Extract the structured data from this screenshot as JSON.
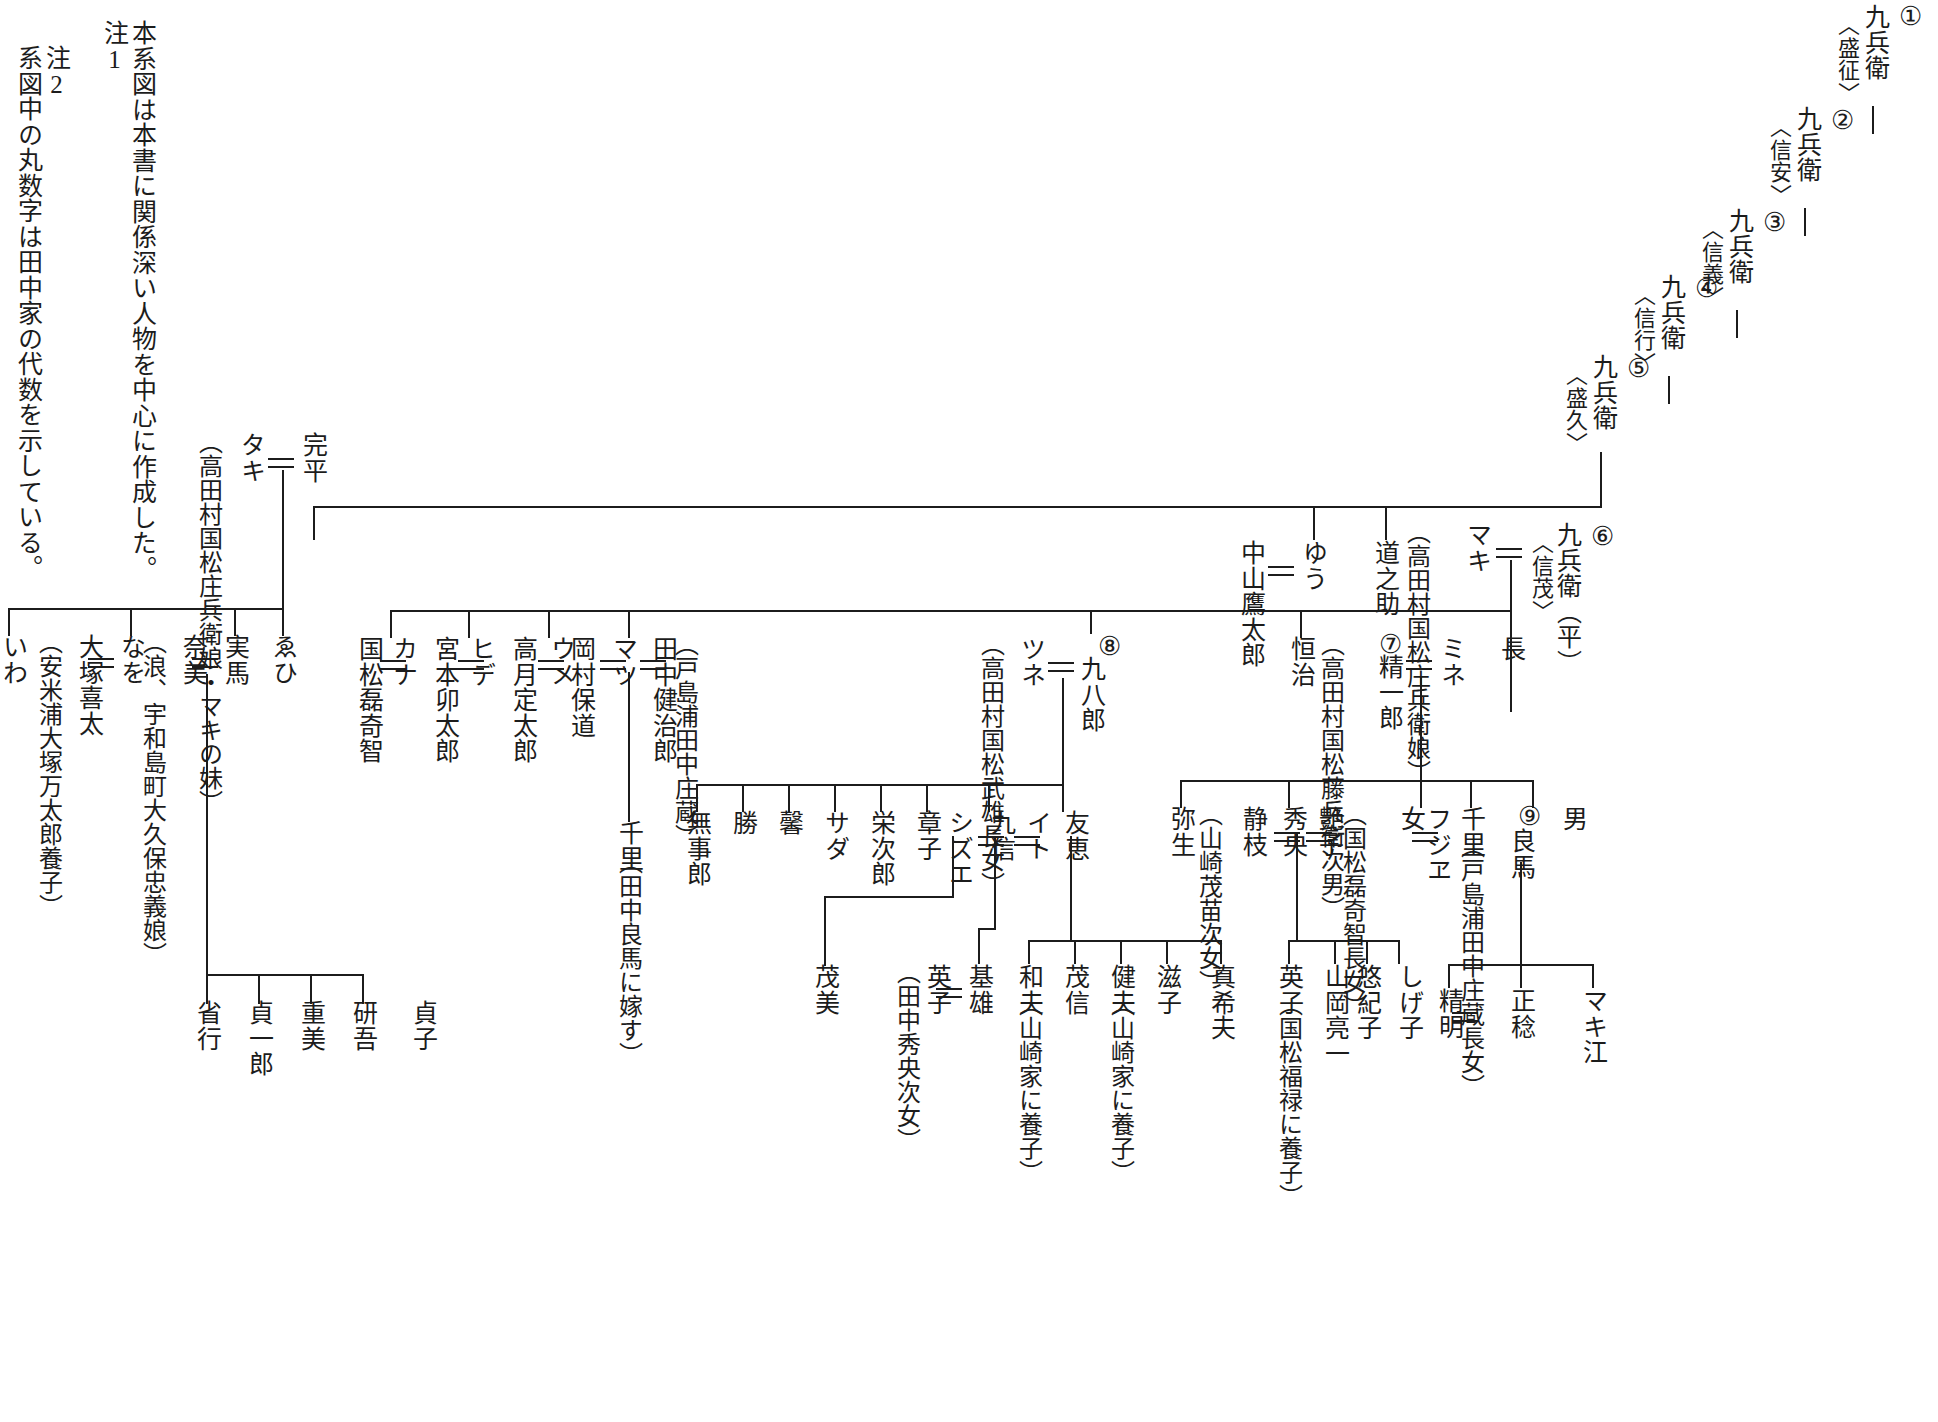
{
  "notes": [
    {
      "label": "注1",
      "text": "本系図は本書に関係深い人物を中心に作成した。"
    },
    {
      "label": "注2",
      "text": "系図中の丸数字は田中家の代数を示している。"
    }
  ],
  "generations": [
    {
      "num": "①",
      "name": "九兵衛",
      "kakumei": "〈盛征〉"
    },
    {
      "num": "②",
      "name": "九兵衛",
      "kakumei": "〈信安〉"
    },
    {
      "num": "③",
      "name": "九兵衛",
      "kakumei": "〈信義〉"
    },
    {
      "num": "④",
      "name": "九兵衛",
      "kakumei": "〈信行〉"
    },
    {
      "num": "⑤",
      "name": "九兵衛",
      "kakumei": "〈盛久〉"
    },
    {
      "num": "⑥",
      "name": "九兵衛（平）",
      "kakumei": "〈信茂〉"
    }
  ],
  "gen6_row": {
    "head": "九兵衛（平）",
    "head_kakumei": "〈信茂〉",
    "head_num": "⑥",
    "spouse": "マキ",
    "spouse_note": "高田村国松庄兵衛娘",
    "siblings": [
      {
        "name": "ゆう",
        "spouse": "中山鷹太郎"
      },
      {
        "name": "道之助"
      }
    ]
  },
  "gen6_children": [
    {
      "name": "長"
    },
    {
      "name": "ミネ",
      "spouse": "精一郎",
      "spouse_num": "⑦",
      "spouse_note": "高田村国松藤兵衛次男"
    },
    {
      "name": "恒治"
    },
    {
      "name": "九八郎",
      "num": "⑧",
      "spouse": "ツネ",
      "spouse_note": "高田村国松武雄長女"
    },
    {
      "name": "完平",
      "spouse": "タキ",
      "spouse_note": "高田村国松庄兵衛娘・マキの妹"
    }
  ],
  "kanpei_children": [
    {
      "name": "ゑひ"
    },
    {
      "name": "実馬",
      "spouse": "奈美",
      "spouse_note": "浪、宇和島町大久保忠義娘"
    },
    {
      "name": "なを",
      "spouse": "大塚喜太",
      "spouse_note": "安米浦大塚万太郎養子"
    },
    {
      "name": "いわ"
    }
  ],
  "jitsuma_children": [
    "貞子",
    "研吾",
    "重美",
    "貞一郎",
    "省行"
  ],
  "makimine_children": [
    {
      "name": "国松磊奇智",
      "spouse": "カナ"
    },
    {
      "name": "宮本卯太郎",
      "spouse": "ヒデ"
    },
    {
      "name": "高月定太郎",
      "spouse": "ウメ"
    },
    {
      "name": "岡村保道",
      "spouse": "マツ",
      "spouse2": "田中健治郎",
      "spouse2_note": "戸島浦田中庄蔵"
    }
  ],
  "matsu_child": {
    "name": "千里",
    "note": "田中良馬に嫁す"
  },
  "kuhachiro_children": [
    "無事郎",
    "勝",
    "馨",
    "サダ",
    "栄次郎",
    "章子",
    {
      "name": "九信",
      "spouse": "シズエ"
    },
    "イト",
    {
      "name": "友恵"
    }
  ],
  "shizue_child": "茂美",
  "kunobu_children": [
    {
      "name": "基雄",
      "spouse": "英子",
      "spouse_note": "田中秀央次女"
    }
  ],
  "tomoe_children": [
    {
      "name": "和夫",
      "note": "山崎家に養子"
    },
    {
      "name": "茂信"
    },
    {
      "name": "健夫",
      "note": "山崎家に養子"
    },
    {
      "name": "滋子"
    },
    {
      "name": "真希夫"
    }
  ],
  "seiichiro_children": [
    {
      "name": "弥生"
    },
    {
      "name": "秀央",
      "spouse": "静枝",
      "spouse_note": "山崎茂苗次女",
      "spouse2": "艶子",
      "spouse2_note": "国松磊奇智長女"
    },
    {
      "name": "女",
      "spouse": "フジヱ",
      "spouse_note": "高田村"
    },
    {
      "name": "千里",
      "spouse_note": "戸島浦田中庄蔵長女"
    },
    {
      "name": "良馬",
      "num": "⑨"
    },
    {
      "name": "男"
    }
  ],
  "hideo_children": [
    {
      "name": "英子",
      "note": "国松福禄に養子"
    },
    {
      "name": "山岡亮一"
    },
    {
      "name": "悠紀子"
    },
    {
      "name": "しげ子"
    }
  ],
  "ryoma_children": [
    "精明",
    "正稔",
    "マキ江"
  ],
  "colors": {
    "line": "#1c1c1c",
    "bg": "#ffffff",
    "text": "#1a1a1a"
  }
}
